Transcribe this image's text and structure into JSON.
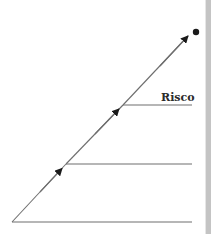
{
  "diagram": {
    "type": "staircase-arrow-diagram",
    "labels": [
      {
        "id": "risco",
        "text": "Risco",
        "x": 160,
        "y": 92
      }
    ],
    "colors": {
      "line": "#6e6e6e",
      "arrow": "#1a1a1a",
      "dot": "#1a1a1a",
      "side_bar": "#c4c4c4",
      "label": "#2b2b2b"
    },
    "levels": [
      {
        "name": "level-1",
        "y": 222,
        "x_start": 12,
        "x_end": 192
      },
      {
        "name": "level-2",
        "y": 164,
        "x_start": 66,
        "x_end": 192
      },
      {
        "name": "level-3",
        "y": 105,
        "x_start": 123,
        "x_end": 192
      }
    ],
    "arrows": [
      {
        "from": [
          12,
          222
        ],
        "to": [
          66,
          164
        ]
      },
      {
        "from": [
          66,
          164
        ],
        "to": [
          123,
          105
        ]
      },
      {
        "from": [
          123,
          105
        ],
        "to": [
          188,
          36
        ]
      }
    ],
    "endpoint_dot": {
      "cx": 196,
      "cy": 32,
      "r": 3
    }
  }
}
